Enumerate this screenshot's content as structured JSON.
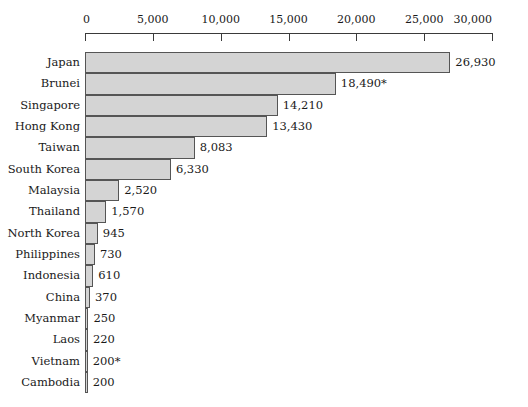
{
  "chart_data": {
    "type": "bar",
    "orientation": "horizontal",
    "title": "",
    "subtitle": "",
    "xlabel": "",
    "ylabel": "",
    "xlim": [
      0,
      30000
    ],
    "grid": false,
    "legend": null,
    "axis_ticks": [
      {
        "value": 0,
        "label": "0"
      },
      {
        "value": 5000,
        "label": "5,000"
      },
      {
        "value": 10000,
        "label": "10,000"
      },
      {
        "value": 15000,
        "label": "15,000"
      },
      {
        "value": 20000,
        "label": "20,000"
      },
      {
        "value": 25000,
        "label": "25,000"
      },
      {
        "value": 30000,
        "label": "30,000"
      }
    ],
    "categories": [
      "Japan",
      "Brunei",
      "Singapore",
      "Hong Kong",
      "Taiwan",
      "South Korea",
      "Malaysia",
      "Thailand",
      "North Korea",
      "Philippines",
      "Indonesia",
      "China",
      "Myanmar",
      "Laos",
      "Vietnam",
      "Cambodia"
    ],
    "values": [
      26930,
      18490,
      14210,
      13430,
      8083,
      6330,
      2520,
      1570,
      945,
      730,
      610,
      370,
      250,
      220,
      200,
      200
    ],
    "data_labels": [
      "26,930",
      "18,490*",
      "14,210",
      "13,430",
      "8,083",
      "6,330",
      "2,520",
      "1,570",
      "945",
      "730",
      "610",
      "370",
      "250",
      "220",
      "200*",
      "200"
    ],
    "annotations": [
      "* indicates estimated value"
    ],
    "colors": {
      "bar_fill": "#d4d4d4",
      "bar_stroke": "#555555",
      "axis": "#3a3a3a",
      "text": "#1a1a1a",
      "background": "#ffffff"
    }
  },
  "layout": {
    "axis_origin_x": 85,
    "axis_end_x": 492,
    "plot_top": 52,
    "bar_height": 21.33
  }
}
